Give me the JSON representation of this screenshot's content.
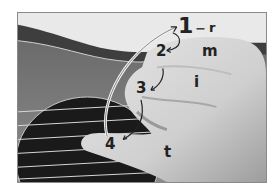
{
  "figure": {
    "order_labels": [
      "1",
      "2",
      "3",
      "4"
    ],
    "finger_labels": {
      "r": "r",
      "m": "m",
      "i": "i",
      "t": "t"
    }
  }
}
